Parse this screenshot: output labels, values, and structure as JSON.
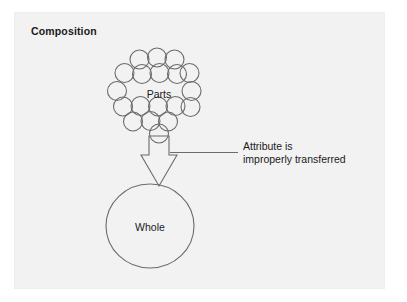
{
  "panel": {
    "background_color": "#f2f2f2",
    "page_background_color": "#ffffff"
  },
  "title": "Composition",
  "labels": {
    "parts": "Parts",
    "whole": "Whole"
  },
  "annotation": {
    "line1": "Attribute is",
    "line2": "improperly transferred"
  },
  "diagram": {
    "type": "concept-diagram",
    "stroke_color": "#6b6b6b",
    "text_color": "#1a1a1a",
    "parts_cluster": {
      "shape": "circle-cluster",
      "circle_count": 19,
      "circle_radius": 9.5,
      "stroke_width": 1.1,
      "circles": [
        {
          "cx": 139.5,
          "cy": 59.5
        },
        {
          "cx": 157.0,
          "cy": 57.5
        },
        {
          "cx": 174.5,
          "cy": 59.5
        },
        {
          "cx": 124.5,
          "cy": 73.0
        },
        {
          "cx": 142.0,
          "cy": 74.0
        },
        {
          "cx": 159.5,
          "cy": 73.0
        },
        {
          "cx": 177.0,
          "cy": 74.0
        },
        {
          "cx": 189.5,
          "cy": 73.0
        },
        {
          "cx": 117.0,
          "cy": 91.0
        },
        {
          "cx": 191.5,
          "cy": 91.0
        },
        {
          "cx": 123.0,
          "cy": 106.5
        },
        {
          "cx": 140.5,
          "cy": 106.0
        },
        {
          "cx": 158.0,
          "cy": 106.5
        },
        {
          "cx": 175.5,
          "cy": 106.0
        },
        {
          "cx": 190.5,
          "cy": 107.0
        },
        {
          "cx": 133.0,
          "cy": 121.5
        },
        {
          "cx": 150.5,
          "cy": 121.0
        },
        {
          "cx": 168.0,
          "cy": 121.5
        },
        {
          "cx": 159.0,
          "cy": 133.5
        }
      ]
    },
    "arrow": {
      "shape": "hollow-block-arrow",
      "direction": "down",
      "points": "149,136 169,136 169,155 177,155 159,186 141,155 149,155",
      "stroke_width": 1.1
    },
    "whole_ellipse": {
      "shape": "ellipse",
      "cx": 150.0,
      "cy": 226.0,
      "rx": 44.0,
      "ry": 42.0,
      "stroke_width": 1.1
    },
    "leader_line": {
      "x1": 170.0,
      "y1": 152.5,
      "x2": 238.0,
      "y2": 152.5,
      "stroke_width": 1.0
    }
  }
}
